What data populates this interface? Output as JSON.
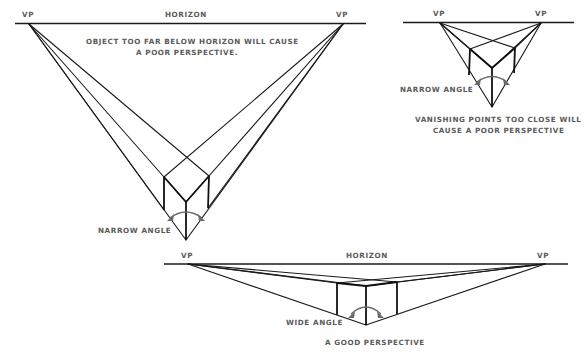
{
  "diagrams": {
    "far_below": {
      "horizon_label": "HORIZON",
      "vp_left_label": "VP",
      "vp_right_label": "VP",
      "caption_line1": "OBJECT TOO FAR BELOW HORIZON WILL CAUSE",
      "caption_line2": "A POOR PERSPECTIVE.",
      "angle_label": "NARROW ANGLE"
    },
    "close_vps": {
      "vp_left_label": "VP",
      "vp_right_label": "VP",
      "angle_label": "NARROW ANGLE",
      "caption_line1": "VANISHING POINTS TOO CLOSE WILL",
      "caption_line2": "CAUSE A POOR PERSPECTIVE"
    },
    "good": {
      "horizon_label": "HORIZON",
      "vp_left_label": "VP",
      "vp_right_label": "VP",
      "angle_label": "WIDE ANGLE",
      "caption": "A GOOD PERSPECTIVE"
    }
  },
  "colors": {
    "line": "#1a1a1a",
    "text": "#5a5a5a",
    "arrow": "#6a6a6a",
    "background": "#ffffff"
  }
}
